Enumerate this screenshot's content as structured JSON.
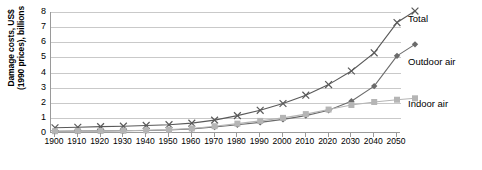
{
  "chart_data": {
    "type": "line",
    "title": "",
    "xlabel": "",
    "ylabel": "Damage costs, US$ (1990 prices), billions",
    "ylabel_lines": [
      "Damage costs, US$",
      "(1990 prices), billions"
    ],
    "xlim": [
      1900,
      2050
    ],
    "ylim": [
      0,
      8
    ],
    "yticks": [
      0,
      1,
      2,
      3,
      4,
      5,
      6,
      7,
      8
    ],
    "grid": true,
    "legend_position": "right",
    "categories": [
      1900,
      1910,
      1920,
      1930,
      1940,
      1950,
      1960,
      1970,
      1980,
      1990,
      2000,
      2010,
      2020,
      2030,
      2040,
      2050
    ],
    "series": [
      {
        "name": "Total",
        "marker": "x",
        "color": "#595959",
        "values": [
          0.35,
          0.38,
          0.42,
          0.45,
          0.5,
          0.55,
          0.65,
          0.85,
          1.15,
          1.5,
          1.95,
          2.5,
          3.2,
          4.1,
          5.3,
          7.3
        ]
      },
      {
        "name": "Outdoor air",
        "marker": "diamond",
        "color": "#6b6b6b",
        "values": [
          0.12,
          0.13,
          0.14,
          0.15,
          0.17,
          0.2,
          0.27,
          0.4,
          0.55,
          0.7,
          0.9,
          1.15,
          1.5,
          2.1,
          3.1,
          5.1
        ]
      },
      {
        "name": "Indoor air",
        "marker": "square",
        "color": "#b5b5b5",
        "values": [
          0.12,
          0.13,
          0.14,
          0.15,
          0.18,
          0.22,
          0.3,
          0.45,
          0.62,
          0.8,
          1.0,
          1.25,
          1.55,
          1.85,
          2.05,
          2.2
        ]
      }
    ]
  },
  "legend": {
    "items": [
      {
        "label": "Total"
      },
      {
        "label": "Outdoor air"
      },
      {
        "label": "Indoor air"
      }
    ]
  },
  "colors": {
    "total": "#595959",
    "outdoor_air": "#6b6b6b",
    "indoor_air": "#b5b5b5",
    "gridline": "#c9c9c9",
    "axis": "#9a9a9a",
    "background": "#ffffff"
  }
}
